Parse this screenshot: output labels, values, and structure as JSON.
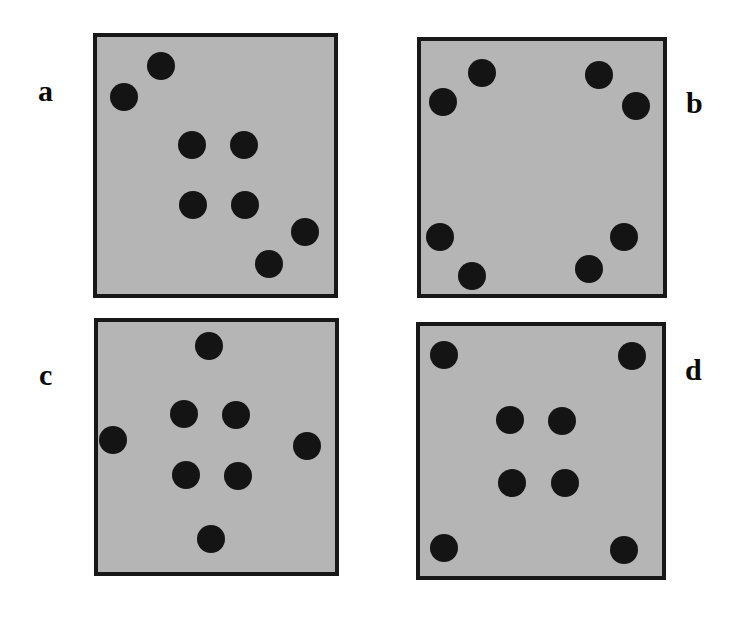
{
  "figure": {
    "width": 732,
    "height": 628,
    "background_color": "#ffffff",
    "panel_fill_color": "#b5b5b5",
    "panel_border_color": "#181818",
    "dot_color": "#141414",
    "dot_diameter": 28,
    "panels": [
      {
        "id": "a",
        "label": "a",
        "label_x": 38,
        "label_y": 76,
        "box": {
          "x": 93,
          "y": 33,
          "width": 245,
          "height": 265
        },
        "dot_count": 8,
        "dots": [
          {
            "x": 161,
            "y": 66
          },
          {
            "x": 124,
            "y": 97
          },
          {
            "x": 192,
            "y": 145
          },
          {
            "x": 244,
            "y": 145
          },
          {
            "x": 193,
            "y": 205
          },
          {
            "x": 245,
            "y": 205
          },
          {
            "x": 305,
            "y": 232
          },
          {
            "x": 269,
            "y": 264
          }
        ]
      },
      {
        "id": "b",
        "label": "b",
        "label_x": 686,
        "label_y": 88,
        "box": {
          "x": 417,
          "y": 37,
          "width": 250,
          "height": 261
        },
        "dot_count": 8,
        "dots": [
          {
            "x": 482,
            "y": 73
          },
          {
            "x": 443,
            "y": 102
          },
          {
            "x": 599,
            "y": 75
          },
          {
            "x": 636,
            "y": 106
          },
          {
            "x": 440,
            "y": 237
          },
          {
            "x": 472,
            "y": 276
          },
          {
            "x": 624,
            "y": 237
          },
          {
            "x": 589,
            "y": 269
          }
        ]
      },
      {
        "id": "c",
        "label": "c",
        "label_x": 39,
        "label_y": 360,
        "box": {
          "x": 94,
          "y": 318,
          "width": 245,
          "height": 258
        },
        "dot_count": 8,
        "dots": [
          {
            "x": 209,
            "y": 346
          },
          {
            "x": 184,
            "y": 414
          },
          {
            "x": 236,
            "y": 415
          },
          {
            "x": 113,
            "y": 440
          },
          {
            "x": 307,
            "y": 446
          },
          {
            "x": 186,
            "y": 475
          },
          {
            "x": 238,
            "y": 476
          },
          {
            "x": 211,
            "y": 539
          }
        ]
      },
      {
        "id": "d",
        "label": "d",
        "label_x": 685,
        "label_y": 355,
        "box": {
          "x": 416,
          "y": 322,
          "width": 250,
          "height": 258
        },
        "dot_count": 8,
        "dots": [
          {
            "x": 444,
            "y": 355
          },
          {
            "x": 632,
            "y": 356
          },
          {
            "x": 510,
            "y": 420
          },
          {
            "x": 562,
            "y": 421
          },
          {
            "x": 512,
            "y": 483
          },
          {
            "x": 565,
            "y": 483
          },
          {
            "x": 444,
            "y": 548
          },
          {
            "x": 624,
            "y": 550
          }
        ]
      }
    ]
  }
}
